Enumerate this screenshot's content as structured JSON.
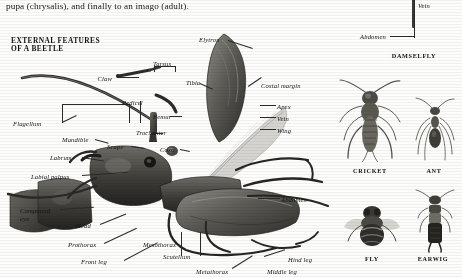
{
  "page": {
    "intro_text": "pupa (chrysalis), and finally to an imago (adult).",
    "section_title": "EXTERNAL FEATURES\nOF A BEETLE"
  },
  "colors": {
    "background": "#fdfdfc",
    "ink": "#1a1a1a",
    "leader": "#2b2b2b",
    "specimen_dark": "#3a3a38",
    "specimen_mid": "#7c7a75",
    "specimen_light": "#b9b7b1",
    "wing_membrane": "#cfcdc8"
  },
  "beetle_labels": [
    {
      "id": "elytron",
      "text": "Elytron",
      "x": 199,
      "y": 36,
      "align": "left"
    },
    {
      "id": "tarsus",
      "text": "Tarsus",
      "x": 153,
      "y": 60,
      "align": "left"
    },
    {
      "id": "claw",
      "text": "Claw",
      "x": 112,
      "y": 75,
      "align": "right"
    },
    {
      "id": "tibia",
      "text": "Tibia",
      "x": 186,
      "y": 79,
      "align": "left"
    },
    {
      "id": "costal-margin",
      "text": "Costal margin",
      "x": 261,
      "y": 82,
      "align": "left"
    },
    {
      "id": "pedicel",
      "text": "Pedicel",
      "x": 122,
      "y": 99,
      "align": "left"
    },
    {
      "id": "femur",
      "text": "Femur",
      "x": 153,
      "y": 113,
      "align": "left"
    },
    {
      "id": "apex",
      "text": "Apex",
      "x": 277,
      "y": 103,
      "align": "left"
    },
    {
      "id": "flagellum",
      "text": "Flagellum",
      "x": 13,
      "y": 120,
      "align": "left"
    },
    {
      "id": "vein",
      "text": "Vein",
      "x": 277,
      "y": 115,
      "align": "left"
    },
    {
      "id": "trochanter",
      "text": "Trochanter",
      "x": 136,
      "y": 129,
      "align": "left"
    },
    {
      "id": "wing",
      "text": "Wing",
      "x": 277,
      "y": 127,
      "align": "left"
    },
    {
      "id": "mandible",
      "text": "Mandible",
      "x": 62,
      "y": 136,
      "align": "left"
    },
    {
      "id": "scape",
      "text": "Scape",
      "x": 107,
      "y": 143,
      "align": "left"
    },
    {
      "id": "coxa",
      "text": "Coxa",
      "x": 160,
      "y": 146,
      "align": "left"
    },
    {
      "id": "labrum",
      "text": "Labrum",
      "x": 50,
      "y": 154,
      "align": "left"
    },
    {
      "id": "labial-palpus",
      "text": "Labial palpus",
      "x": 31,
      "y": 173,
      "align": "left"
    },
    {
      "id": "abdomen-beetle",
      "text": "Abdomen",
      "x": 281,
      "y": 196,
      "align": "left"
    },
    {
      "id": "compound-eye",
      "text": "Compound",
      "x": 20,
      "y": 207,
      "align": "left"
    },
    {
      "id": "eye",
      "text": "eye",
      "x": 20,
      "y": 215,
      "align": "left"
    },
    {
      "id": "head",
      "text": "Head",
      "x": 76,
      "y": 222,
      "align": "left"
    },
    {
      "id": "prothorax",
      "text": "Prothorax",
      "x": 68,
      "y": 241,
      "align": "left"
    },
    {
      "id": "mesothorax",
      "text": "Mesothorax",
      "x": 143,
      "y": 241,
      "align": "left"
    },
    {
      "id": "front-leg",
      "text": "Front leg",
      "x": 81,
      "y": 258,
      "align": "left"
    },
    {
      "id": "scutellum",
      "text": "Scutellum",
      "x": 163,
      "y": 253,
      "align": "left"
    },
    {
      "id": "metathorax",
      "text": "Metathorax",
      "x": 196,
      "y": 268,
      "align": "left"
    },
    {
      "id": "middle-leg",
      "text": "Middle leg",
      "x": 267,
      "y": 268,
      "align": "left"
    },
    {
      "id": "hind-leg",
      "text": "Hind leg",
      "x": 288,
      "y": 256,
      "align": "left"
    }
  ],
  "damselfly": {
    "caption": "DAMSELFLY",
    "labels": [
      {
        "id": "vein-damselfly",
        "text": "Vein",
        "x": 418,
        "y": 2,
        "align": "left"
      },
      {
        "id": "abdomen-damselfly",
        "text": "Abdomen",
        "x": 386,
        "y": 33,
        "align": "right"
      }
    ]
  },
  "specimens": [
    {
      "id": "cricket",
      "caption": "CRICKET",
      "cx": 370,
      "cy": 120,
      "caption_y": 170
    },
    {
      "id": "ant",
      "caption": "ANT",
      "cx": 434,
      "cy": 130,
      "caption_y": 170
    },
    {
      "id": "fly",
      "caption": "FLY",
      "cx": 372,
      "cy": 232,
      "caption_y": 258
    },
    {
      "id": "earwig",
      "caption": "EARWIG",
      "cx": 433,
      "cy": 228,
      "caption_y": 258
    }
  ]
}
